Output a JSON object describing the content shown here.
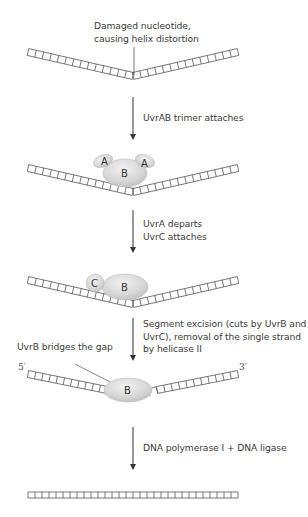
{
  "diagram": {
    "steps": [
      {
        "id": "damaged-dna",
        "label_lines": [
          "Damaged nucleotide,",
          "causing helix distortion"
        ],
        "dna_shape": "bent"
      },
      {
        "id": "uvrab-attach",
        "arrow_label": "UvrAB trimer attaches",
        "proteins": [
          {
            "name": "A",
            "shape": "ellipse"
          },
          {
            "name": "B",
            "shape": "ellipse"
          },
          {
            "name": "A",
            "shape": "ellipse"
          }
        ],
        "dna_shape": "bent"
      },
      {
        "id": "uvrc-attach",
        "arrow_label_lines": [
          "UvrA departs",
          "UvrC attaches"
        ],
        "proteins": [
          {
            "name": "C",
            "shape": "circle"
          },
          {
            "name": "B",
            "shape": "ellipse"
          }
        ],
        "dna_shape": "bent"
      },
      {
        "id": "excision",
        "arrow_label_lines": [
          "Segment excision (cuts by UvrB and",
          "UvrC), removal of the single strand",
          "by helicase II"
        ],
        "callout": "UvrB bridges the gap",
        "end_5": "5′",
        "end_3": "3′",
        "proteins": [
          {
            "name": "B",
            "shape": "ellipse"
          }
        ],
        "dna_shape": "bent-gapped"
      },
      {
        "id": "repair",
        "arrow_label": "DNA polymerase I + DNA ligase",
        "dna_shape": "straight"
      }
    ],
    "colors": {
      "dna_line": "#555555",
      "arrow": "#333333",
      "protein_fill": "#d9d9d9",
      "text": "#3c3c3c"
    }
  }
}
